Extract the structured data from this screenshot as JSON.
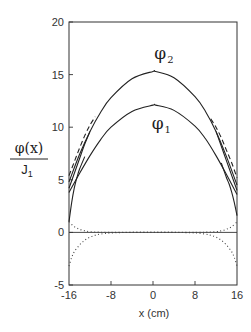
{
  "chart_data": {
    "type": "line",
    "title": "",
    "xlabel": "x (cm)",
    "ylabel": {
      "numerator": "φ(x)",
      "denominator": "J",
      "denominator_sub": "1"
    },
    "xlim": [
      -16,
      16
    ],
    "ylim": [
      -5,
      20
    ],
    "x_ticks": [
      -16,
      -8,
      0,
      8,
      16
    ],
    "x_tick_labels": [
      "-16",
      "-8",
      "0",
      "8",
      "16"
    ],
    "y_ticks": [
      -5,
      0,
      5,
      10,
      15,
      20
    ],
    "y_tick_labels": [
      "-5",
      "0",
      "5",
      "10",
      "15",
      "20"
    ],
    "grid": false,
    "annotations": [
      {
        "text": "φ",
        "sub": "2",
        "x": 1.0,
        "y": 16.5,
        "target_series": "phi2"
      },
      {
        "text": "φ",
        "sub": "1",
        "x": 0.5,
        "y": 9.8,
        "target_series": "phi1"
      }
    ],
    "series": [
      {
        "name": "phi2",
        "label": "φ2",
        "style": "solid",
        "x": [
          -16,
          -14,
          -12,
          -10,
          -8,
          -4,
          0,
          0.5,
          4,
          8,
          10,
          12,
          14,
          16
        ],
        "y": [
          4.8,
          7.4,
          9.6,
          11.4,
          12.8,
          14.6,
          15.3,
          15.3,
          14.7,
          12.9,
          11.5,
          9.6,
          7.2,
          4.5
        ]
      },
      {
        "name": "phi1",
        "label": "φ1",
        "style": "solid",
        "x": [
          -16,
          -14,
          -12,
          -10,
          -8,
          -4,
          0,
          0.5,
          4,
          8,
          10,
          12,
          14,
          16
        ],
        "y": [
          3.8,
          5.6,
          7.3,
          8.8,
          10.0,
          11.5,
          12.1,
          12.1,
          11.6,
          10.1,
          8.9,
          7.3,
          5.5,
          3.6
        ]
      },
      {
        "name": "phi2_edge_solid_left",
        "style": "solid",
        "x": [
          -16,
          -15,
          -14,
          -13,
          -12
        ],
        "y": [
          4.2,
          5.6,
          7.0,
          8.4,
          9.6
        ]
      },
      {
        "name": "phi1_boundary_left",
        "style": "solid",
        "x": [
          -16,
          -15.5,
          -15,
          -14.5,
          -14,
          -13
        ],
        "y": [
          1.0,
          2.8,
          4.2,
          5.2,
          6.0,
          7.2
        ]
      },
      {
        "name": "phi2_edge_solid_right",
        "style": "solid",
        "x": [
          12,
          13,
          14,
          15,
          16
        ],
        "y": [
          9.6,
          8.2,
          6.8,
          5.4,
          4.0
        ]
      },
      {
        "name": "phi1_boundary_right",
        "style": "solid",
        "x": [
          13,
          14,
          14.5,
          15,
          15.5,
          16
        ],
        "y": [
          6.6,
          5.2,
          4.6,
          3.8,
          2.8,
          1.6
        ]
      },
      {
        "name": "diffusion_dashed_left",
        "style": "dashed",
        "x": [
          -16,
          -15,
          -14,
          -13,
          -12,
          -11
        ],
        "y": [
          5.4,
          6.7,
          8.0,
          9.2,
          10.2,
          11.0
        ]
      },
      {
        "name": "diffusion_dashed_right",
        "style": "dashed",
        "x": [
          11,
          12,
          13,
          14,
          15,
          16
        ],
        "y": [
          10.8,
          10.0,
          9.0,
          7.8,
          6.6,
          5.2
        ]
      },
      {
        "name": "dotted_positive",
        "style": "dotted",
        "x": [
          -16,
          -15,
          -14,
          -13,
          -12,
          -10,
          -6,
          0,
          6,
          10,
          12,
          13,
          14,
          15,
          16
        ],
        "y": [
          1.0,
          0.55,
          0.3,
          0.15,
          0.07,
          0.02,
          0,
          0,
          0,
          0.02,
          0.07,
          0.15,
          0.3,
          0.55,
          1.0
        ]
      },
      {
        "name": "dotted_negative",
        "style": "dotted",
        "x": [
          -16,
          -15.5,
          -15,
          -14,
          -13,
          -12,
          -11,
          -10,
          -8,
          -4,
          0,
          4,
          8,
          10,
          11,
          12,
          13,
          14,
          15,
          15.5,
          16
        ],
        "y": [
          -3.2,
          -2.4,
          -1.85,
          -1.2,
          -0.75,
          -0.45,
          -0.27,
          -0.16,
          -0.05,
          0,
          0,
          0,
          -0.05,
          -0.16,
          -0.27,
          -0.45,
          -0.75,
          -1.2,
          -1.85,
          -2.4,
          -3.2
        ]
      }
    ]
  },
  "plot_area": {
    "left": 69,
    "right": 237,
    "top": 22,
    "bottom": 285
  }
}
